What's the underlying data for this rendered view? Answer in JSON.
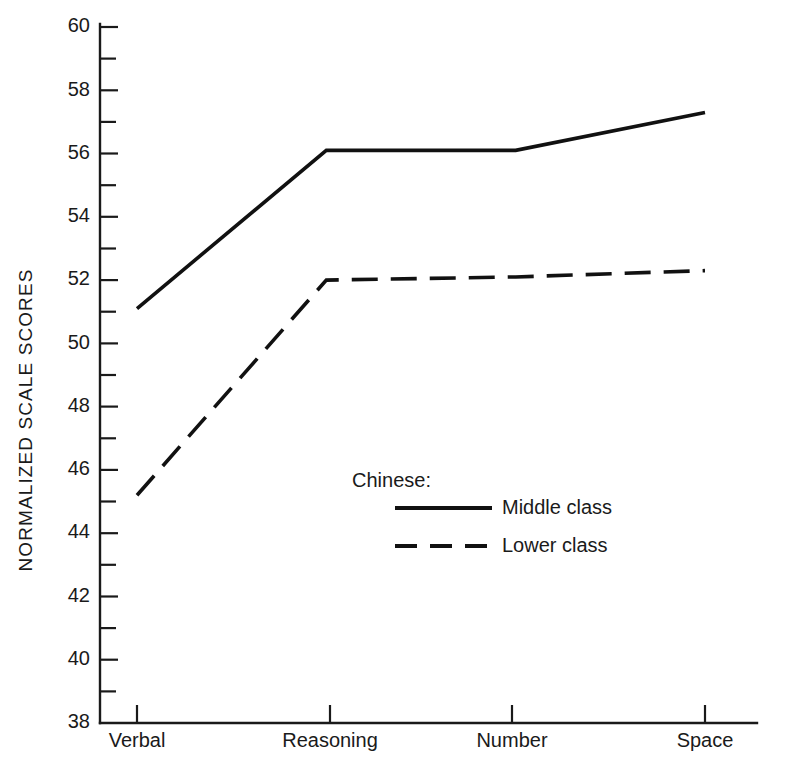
{
  "chart_data": {
    "type": "line",
    "title": "",
    "xlabel": "",
    "ylabel": "NORMALIZED SCALE SCORES",
    "categories": [
      "Verbal",
      "Reasoning",
      "Number",
      "Space"
    ],
    "ylim": [
      38,
      60
    ],
    "ytick_major": [
      38,
      40,
      42,
      44,
      46,
      48,
      50,
      52,
      54,
      56,
      58,
      60
    ],
    "ytick_minor": [
      39,
      41,
      43,
      45,
      47,
      49,
      51,
      53,
      55,
      57,
      59
    ],
    "grid": false,
    "legend_position": "center",
    "legend_title": "Chinese:",
    "series": [
      {
        "name": "Middle class",
        "style": "solid",
        "color": "#111111",
        "values": [
          51.1,
          56.1,
          56.1,
          57.3
        ]
      },
      {
        "name": "Lower class",
        "style": "dashed",
        "color": "#111111",
        "values": [
          45.2,
          52.0,
          52.1,
          52.3
        ]
      }
    ]
  },
  "axis": {
    "y_title": "NORMALIZED SCALE SCORES",
    "y_labels": {
      "t60": "60",
      "t58": "58",
      "t56": "56",
      "t54": "54",
      "t52": "52",
      "t50": "50",
      "t48": "48",
      "t46": "46",
      "t44": "44",
      "t42": "42",
      "t40": "40",
      "t38": "38"
    },
    "x_labels": {
      "c0": "Verbal",
      "c1": "Reasoning",
      "c2": "Number",
      "c3": "Space"
    }
  },
  "legend": {
    "title": "Chinese:",
    "items": [
      {
        "label": "Middle class",
        "style": "solid"
      },
      {
        "label": "Lower class",
        "style": "dashed"
      }
    ]
  }
}
